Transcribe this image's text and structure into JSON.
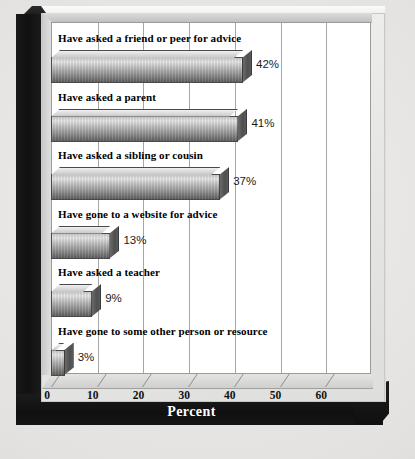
{
  "chart_data": {
    "type": "bar",
    "orientation": "horizontal",
    "title": "",
    "xlabel": "Percent",
    "ylabel": "",
    "xlim": [
      0,
      70
    ],
    "xticks": [
      0,
      10,
      20,
      30,
      40,
      50,
      60
    ],
    "xtick_labels": [
      "0",
      "10",
      "20",
      "30",
      "40",
      "50",
      "60"
    ],
    "grid": true,
    "grid_axis": "x",
    "legend": false,
    "categories": [
      "Have asked a friend or peer for advice",
      "Have asked a parent",
      "Have asked a sibling or cousin",
      "Have gone to a website for advice",
      "Have asked a teacher",
      "Have gone to some other person or resource"
    ],
    "values": [
      42,
      41,
      37,
      13,
      9,
      3
    ],
    "data_labels": [
      "42%",
      "41%",
      "37%",
      "13%",
      "9%",
      "3%"
    ],
    "bar_style": "3d-extruded-gradient",
    "colors": {
      "bar_light": "#e4e4e4",
      "bar_dark": "#5e5e5e",
      "bar_outline": "#4a4a4a",
      "plot_background": "#ffffff",
      "gridline": "#a6a6a6",
      "frame_dark": "#111111",
      "card_background": "#eeeeec",
      "axis_title_color": "#ffffff",
      "text": "#000000"
    }
  }
}
